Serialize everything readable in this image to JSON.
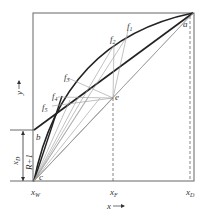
{
  "diagram": {
    "type": "McCabe-Thiele minimum stages construction",
    "axes": {
      "x_label": "x",
      "y_label": "y",
      "x_ticks": [
        "x_W",
        "x_F",
        "x_D"
      ]
    },
    "points": {
      "a": "a",
      "b": "b",
      "c": "c",
      "e": "e"
    },
    "f_labels": [
      "f1",
      "f2",
      "f3",
      "f4",
      "f5"
    ],
    "bracket_label": "x_D / (R+1)",
    "colors": {
      "frame": "#555555",
      "curve": "#222222",
      "thin": "#888888"
    }
  },
  "text": {
    "xW": "x",
    "xW_sub": "W",
    "xF": "x",
    "xF_sub": "F",
    "xD": "x",
    "xD_sub": "D",
    "x_axis": "x",
    "y_axis": "y",
    "a": "a",
    "b": "b",
    "c": "c",
    "e": "e",
    "f1": "f",
    "f2": "f",
    "f3": "f",
    "f4": "f",
    "f5": "f",
    "s1": "1",
    "s2": "2",
    "s3": "3",
    "s4": "4",
    "s5": "5",
    "frac_num": "x",
    "frac_num_sub": "D",
    "frac_den": "R+1"
  }
}
